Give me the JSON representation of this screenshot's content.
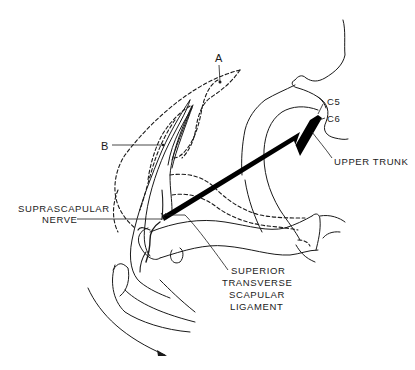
{
  "figure": {
    "ink_color": "#1a1a1a",
    "background_color": "#ffffff"
  },
  "labels": {
    "a": "A",
    "b": "B",
    "c5": "C5",
    "c6": "C6",
    "upper_trunk": "UPPER TRUNK",
    "suprascapular_line1": "SUPRASCAPULAR",
    "suprascapular_line2": "NERVE",
    "ligament_line1": "SUPERIOR",
    "ligament_line2": "TRANSVERSE",
    "ligament_line3": "SCAPULAR",
    "ligament_line4": "LIGAMENT"
  }
}
